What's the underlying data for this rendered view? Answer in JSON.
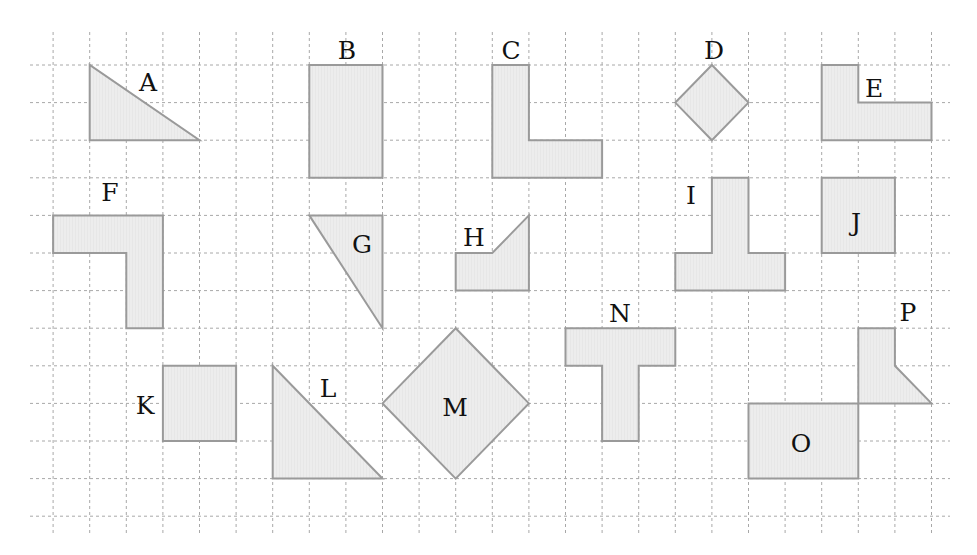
{
  "header": {
    "clipped_text": "",
    "note": "Top line of text is cut off; only descenders visible"
  },
  "grid": {
    "col_origin_x": 16.5,
    "col_spacing": 36.6,
    "row_origin_y": 27.4,
    "row_spacing": 37.6,
    "cols": [
      1,
      25
    ],
    "rows": [
      1,
      13
    ],
    "x_extent": [
      30,
      950
    ],
    "y_extent": [
      32,
      535
    ],
    "line_color": "#a8a8a8"
  },
  "style": {
    "fill": "#ececec",
    "stroke": "#9a9a9a",
    "label_color": "#111111"
  },
  "shapes": [
    {
      "label": "A",
      "points": [
        [
          2,
          1
        ],
        [
          2,
          3
        ],
        [
          5,
          3
        ]
      ],
      "label_pos": [
        148,
        82
      ]
    },
    {
      "label": "B",
      "points": [
        [
          8,
          1
        ],
        [
          10,
          1
        ],
        [
          10,
          4
        ],
        [
          8,
          4
        ]
      ],
      "label_pos": [
        347,
        50
      ]
    },
    {
      "label": "C",
      "points": [
        [
          13,
          1
        ],
        [
          14,
          1
        ],
        [
          14,
          3
        ],
        [
          16,
          3
        ],
        [
          16,
          4
        ],
        [
          13,
          4
        ]
      ],
      "label_pos": [
        511,
        50
      ]
    },
    {
      "label": "D",
      "points": [
        [
          19,
          1
        ],
        [
          20,
          2
        ],
        [
          19,
          3
        ],
        [
          18,
          2
        ]
      ],
      "label_pos": [
        714,
        50
      ]
    },
    {
      "label": "E",
      "points": [
        [
          22,
          1
        ],
        [
          23,
          1
        ],
        [
          23,
          2
        ],
        [
          25,
          2
        ],
        [
          25,
          3
        ],
        [
          22,
          3
        ]
      ],
      "label_pos": [
        874,
        88
      ]
    },
    {
      "label": "F",
      "points": [
        [
          1,
          5
        ],
        [
          4,
          5
        ],
        [
          4,
          8
        ],
        [
          3,
          8
        ],
        [
          3,
          6
        ],
        [
          1,
          6
        ]
      ],
      "label_pos": [
        110,
        192
      ]
    },
    {
      "label": "G",
      "points": [
        [
          8,
          5
        ],
        [
          10,
          5
        ],
        [
          10,
          8
        ]
      ],
      "label_pos": [
        362,
        244
      ]
    },
    {
      "label": "H",
      "points": [
        [
          12,
          6
        ],
        [
          13,
          6
        ],
        [
          14,
          5
        ],
        [
          14,
          7
        ],
        [
          12,
          7
        ]
      ],
      "label_pos": [
        474,
        237
      ]
    },
    {
      "label": "I",
      "points": [
        [
          19,
          4
        ],
        [
          20,
          4
        ],
        [
          20,
          6
        ],
        [
          21,
          6
        ],
        [
          21,
          7
        ],
        [
          18,
          7
        ],
        [
          18,
          6
        ],
        [
          19,
          6
        ]
      ],
      "label_pos": [
        691,
        195
      ]
    },
    {
      "label": "J",
      "points": [
        [
          22,
          4
        ],
        [
          24,
          4
        ],
        [
          24,
          6
        ],
        [
          22,
          6
        ]
      ],
      "label_pos": [
        856,
        222
      ]
    },
    {
      "label": "K",
      "points": [
        [
          4,
          9
        ],
        [
          6,
          9
        ],
        [
          6,
          11
        ],
        [
          4,
          11
        ]
      ],
      "label_pos": [
        145,
        405
      ]
    },
    {
      "label": "L",
      "points": [
        [
          7,
          9
        ],
        [
          7,
          12
        ],
        [
          10,
          12
        ]
      ],
      "label_pos": [
        328,
        388
      ]
    },
    {
      "label": "M",
      "points": [
        [
          12,
          8
        ],
        [
          14,
          10
        ],
        [
          12,
          12
        ],
        [
          10,
          10
        ]
      ],
      "label_pos": [
        455,
        407
      ]
    },
    {
      "label": "N",
      "points": [
        [
          15,
          8
        ],
        [
          18,
          8
        ],
        [
          18,
          9
        ],
        [
          17,
          9
        ],
        [
          17,
          11
        ],
        [
          16,
          11
        ],
        [
          16,
          9
        ],
        [
          15,
          9
        ]
      ],
      "label_pos": [
        620,
        313
      ]
    },
    {
      "label": "O",
      "points": [
        [
          20,
          10
        ],
        [
          23,
          10
        ],
        [
          23,
          12
        ],
        [
          20,
          12
        ]
      ],
      "label_pos": [
        801,
        443
      ]
    },
    {
      "label": "P",
      "points": [
        [
          23,
          8
        ],
        [
          24,
          8
        ],
        [
          24,
          9
        ],
        [
          25,
          10
        ],
        [
          23,
          10
        ]
      ],
      "label_pos": [
        908,
        312
      ]
    }
  ]
}
